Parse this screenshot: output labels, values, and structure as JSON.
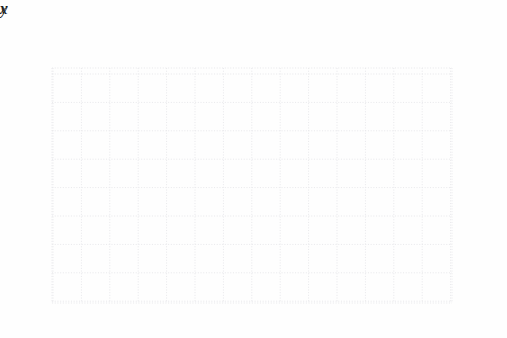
{
  "chart_data": {
    "type": "line",
    "title": "",
    "subtitle": "",
    "xlabel": "x",
    "ylabel": "y",
    "xlim": [
      -10.2,
      4.1
    ],
    "ylim": [
      -3.2,
      5.4
    ],
    "grid": true,
    "grid_step": 1,
    "grid_color": "#e8e8ea",
    "axis_color": "#2b2b2b",
    "curve_color": "#7b7b7b",
    "point_color": "#111111",
    "legend": null,
    "x_tick_labels": [
      "−10",
      "−8",
      "−6",
      "−4",
      "−2",
      "2",
      "4"
    ],
    "x_tick_values": [
      -10,
      -8,
      -6,
      -4,
      -2,
      2,
      4
    ],
    "x_minor_ticks": [
      -9,
      -7,
      -5,
      -3,
      -1,
      1,
      3
    ],
    "y_tick_labels": [
      "4",
      "2",
      "−2"
    ],
    "y_tick_values": [
      4,
      2,
      -2
    ],
    "y_minor_ticks": [
      5,
      3,
      1,
      -1,
      -3
    ],
    "equation": "y = |x + 3| − 2",
    "vertex": [
      -3,
      -2
    ],
    "series": [
      {
        "name": "absolute value graph",
        "x": [
          -10.0,
          -3.0,
          3.7
        ],
        "values": [
          5.1,
          -2.0,
          4.9
        ],
        "arrow_start": true,
        "arrow_end": true
      }
    ],
    "points": [
      {
        "x": -5,
        "y": 0
      },
      {
        "x": -4,
        "y": -1
      },
      {
        "x": -3,
        "y": -2
      },
      {
        "x": -2,
        "y": -1
      },
      {
        "x": -1,
        "y": 0
      }
    ]
  },
  "axes": {
    "x_axis_name": "x",
    "y_axis_name": "y"
  }
}
